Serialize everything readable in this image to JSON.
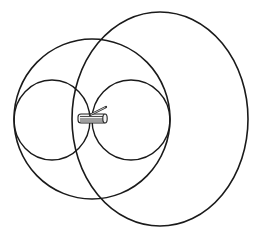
{
  "figure": {
    "line_color": "#1a1a1a",
    "background": "#ffffff",
    "elements": [
      {
        "name": "small-left-lobe",
        "kind": "circle"
      },
      {
        "name": "small-right-lobe",
        "kind": "circle"
      },
      {
        "name": "medium-loop",
        "kind": "circle"
      },
      {
        "name": "large-loop",
        "kind": "circle"
      },
      {
        "name": "coil",
        "kind": "object"
      },
      {
        "name": "coil-rod",
        "kind": "object"
      }
    ]
  }
}
